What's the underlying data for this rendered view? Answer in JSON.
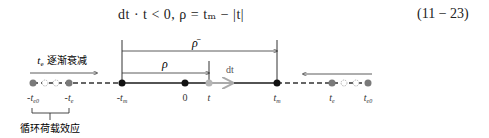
{
  "equation": {
    "text": "dt · t < 0,  ρ = tₘ − |t|",
    "number": "(11 − 23)"
  },
  "diagram": {
    "labels": {
      "rho_bar": "ρ̄",
      "rho": "ρ",
      "dt": "dt",
      "decay_left": "tₑ 逐渐衰减",
      "cyclic_effect": "循环荷载效应"
    },
    "axis_points": [
      {
        "label": "-t_e0",
        "x": 33
      },
      {
        "label": "-t_e",
        "x": 69
      },
      {
        "label": "-t_m",
        "x": 122
      },
      {
        "label": "0",
        "x": 185
      },
      {
        "label": "t",
        "x": 209
      },
      {
        "label": "t_m",
        "x": 277
      },
      {
        "label": "t_e",
        "x": 332
      },
      {
        "label": "t_e0",
        "x": 368
      }
    ],
    "colors": {
      "line": "#1a1a1a",
      "gray_point": "#7a7a7a",
      "light_gray": "#b5b5b5"
    }
  }
}
